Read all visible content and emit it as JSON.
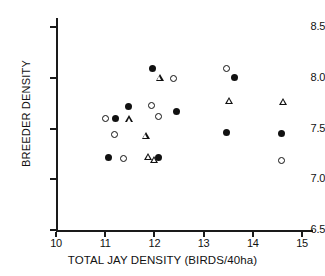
{
  "chart_data": {
    "type": "scatter",
    "title": "",
    "xlabel": "TOTAL JAY DENSITY (BIRDS/40ha)",
    "ylabel": "BREEDER DENSITY",
    "xlim": [
      10,
      15.3
    ],
    "ylim": [
      6.5,
      8.65
    ],
    "xticks": [
      10,
      11,
      12,
      13,
      14,
      15
    ],
    "xtick_labels": [
      "10",
      "11",
      "12",
      "13",
      "14",
      "15"
    ],
    "yticks": [
      6.5,
      7.0,
      7.5,
      8.0,
      8.5
    ],
    "ytick_labels": [
      "6.5",
      "7.0",
      "7.5",
      "8.0",
      "8.5"
    ],
    "grid": false,
    "legend": null,
    "series": [
      {
        "name": "filled-circle",
        "marker": "filled-circle",
        "points": [
          {
            "x": 11.06,
            "y": 7.21
          },
          {
            "x": 11.2,
            "y": 7.6
          },
          {
            "x": 11.47,
            "y": 7.72
          },
          {
            "x": 11.96,
            "y": 8.09
          },
          {
            "x": 12.08,
            "y": 7.21
          },
          {
            "x": 12.45,
            "y": 7.67
          },
          {
            "x": 13.63,
            "y": 8.0
          },
          {
            "x": 13.47,
            "y": 7.46
          },
          {
            "x": 14.59,
            "y": 7.45
          }
        ]
      },
      {
        "name": "open-circle",
        "marker": "open-circle",
        "points": [
          {
            "x": 11.0,
            "y": 7.6
          },
          {
            "x": 11.18,
            "y": 7.44
          },
          {
            "x": 11.37,
            "y": 7.2
          },
          {
            "x": 11.94,
            "y": 7.73
          },
          {
            "x": 12.09,
            "y": 7.62
          },
          {
            "x": 12.38,
            "y": 7.99
          },
          {
            "x": 13.47,
            "y": 8.09
          },
          {
            "x": 14.59,
            "y": 7.18
          }
        ]
      },
      {
        "name": "open-triangle",
        "marker": "open-triangle",
        "points": [
          {
            "x": 11.49,
            "y": 7.59
          },
          {
            "x": 11.82,
            "y": 7.43
          },
          {
            "x": 11.88,
            "y": 7.22
          },
          {
            "x": 12.0,
            "y": 7.19
          },
          {
            "x": 12.11,
            "y": 8.0
          },
          {
            "x": 13.52,
            "y": 7.77
          },
          {
            "x": 14.62,
            "y": 7.76
          }
        ]
      }
    ]
  }
}
